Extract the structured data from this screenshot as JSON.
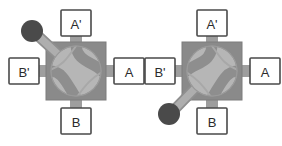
{
  "figure": {
    "type": "schematic-diagram",
    "background": "#ffffff",
    "width": 282,
    "height": 146
  },
  "colors": {
    "body": "#8a8a8a",
    "body_edge": "#7d7d7d",
    "plug_circle": "#b6b6b6",
    "plug_edge": "#9a9a9a",
    "channel": "#8e8e8e",
    "port_pipe": "#9e9e9e",
    "lever_arm": "#a8a8a8",
    "lever_edge": "#8f8f8f",
    "knob": "#4a4a4a",
    "label_box_fill": "#ffffff",
    "label_box_stroke": "#4a4a4a",
    "label_text": "#2b2b2b"
  },
  "valves": [
    {
      "id": "valve-left",
      "name": "left-valve",
      "lever_position": "upper-left",
      "lever_angle_deg": 222,
      "ports": [
        {
          "id": "A-prime",
          "label": "A'",
          "side": "top",
          "arrow": "into-valve"
        },
        {
          "id": "A",
          "label": "A",
          "side": "right",
          "arrow": "into-valve"
        },
        {
          "id": "B",
          "label": "B",
          "side": "bottom",
          "arrow": "into-valve"
        },
        {
          "id": "B-prime",
          "label": "B'",
          "side": "left",
          "arrow": "into-valve"
        }
      ],
      "flow_paths": [
        {
          "from": "A-prime",
          "to": "A"
        },
        {
          "from": "B-prime",
          "to": "B"
        }
      ]
    },
    {
      "id": "valve-right",
      "name": "right-valve",
      "lever_position": "lower-left",
      "lever_angle_deg": 138,
      "ports": [
        {
          "id": "A-prime",
          "label": "A'",
          "side": "top",
          "arrow": "into-valve"
        },
        {
          "id": "A",
          "label": "A",
          "side": "right",
          "arrow": "into-valve"
        },
        {
          "id": "B",
          "label": "B",
          "side": "bottom",
          "arrow": "into-valve"
        },
        {
          "id": "B-prime",
          "label": "B'",
          "side": "left",
          "arrow": "into-valve"
        }
      ],
      "flow_paths": [
        {
          "from": "A-prime",
          "to": "B-prime"
        },
        {
          "from": "A",
          "to": "B"
        }
      ]
    }
  ],
  "labels": {
    "a_prime": "A'",
    "a": "A",
    "b": "B",
    "b_prime": "B'"
  }
}
